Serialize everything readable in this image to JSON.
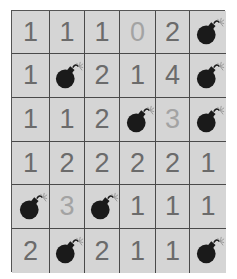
{
  "board": {
    "rows": 6,
    "cols": 6,
    "colors": {
      "cell_bg": "#d5d5d5",
      "grid_line": "#4a4a4a",
      "number": "#6b6b6b",
      "number_light": "#a3a3a3",
      "bomb": "#1a1a1a"
    },
    "cells": [
      [
        {
          "v": "1"
        },
        {
          "v": "1"
        },
        {
          "v": "1"
        },
        {
          "v": "0",
          "light": true
        },
        {
          "v": "2"
        },
        {
          "v": "bomb"
        }
      ],
      [
        {
          "v": "1"
        },
        {
          "v": "bomb"
        },
        {
          "v": "2"
        },
        {
          "v": "1"
        },
        {
          "v": "4"
        },
        {
          "v": "bomb"
        }
      ],
      [
        {
          "v": "1"
        },
        {
          "v": "1"
        },
        {
          "v": "2"
        },
        {
          "v": "bomb"
        },
        {
          "v": "3",
          "light": true
        },
        {
          "v": "bomb"
        }
      ],
      [
        {
          "v": "1"
        },
        {
          "v": "2"
        },
        {
          "v": "2"
        },
        {
          "v": "2"
        },
        {
          "v": "2"
        },
        {
          "v": "1"
        }
      ],
      [
        {
          "v": "bomb"
        },
        {
          "v": "3",
          "light": true
        },
        {
          "v": "bomb"
        },
        {
          "v": "1"
        },
        {
          "v": "1"
        },
        {
          "v": "1"
        }
      ],
      [
        {
          "v": "2"
        },
        {
          "v": "bomb"
        },
        {
          "v": "2"
        },
        {
          "v": "1"
        },
        {
          "v": "1"
        },
        {
          "v": "bomb"
        }
      ]
    ]
  }
}
